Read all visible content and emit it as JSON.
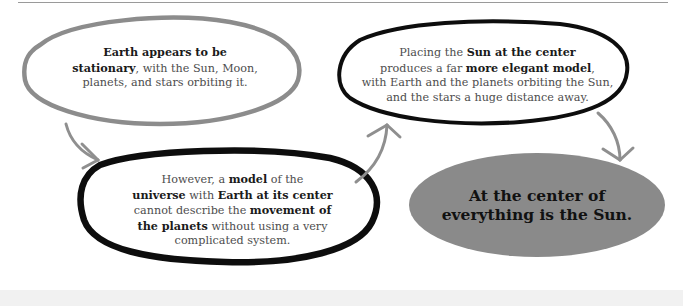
{
  "diagram": {
    "title_rule": true,
    "nodes": [
      {
        "id": "geocentric-observation",
        "style": "gray-outline",
        "segments": [
          {
            "text": "Earth appears to be",
            "bold": true
          },
          {
            "text": "stationary",
            "bold": true
          },
          {
            "text": ", with the Sun, Moon,",
            "bold": false
          },
          {
            "text": "planets, and stars orbiting it.",
            "bold": false
          }
        ]
      },
      {
        "id": "geocentric-problem",
        "style": "thick-black-outline",
        "segments": [
          {
            "text": "However, a ",
            "bold": false
          },
          {
            "text": "model",
            "bold": true
          },
          {
            "text": " of the",
            "bold": false
          },
          {
            "text": "universe",
            "bold": true
          },
          {
            "text": " with ",
            "bold": false
          },
          {
            "text": "Earth at its center",
            "bold": true
          },
          {
            "text": "cannot describe the ",
            "bold": false
          },
          {
            "text": "movement of",
            "bold": true
          },
          {
            "text": "the planets",
            "bold": true
          },
          {
            "text": " without using a very",
            "bold": false
          },
          {
            "text": "complicated system.",
            "bold": false
          }
        ]
      },
      {
        "id": "heliocentric-model",
        "style": "black-outline",
        "segments": [
          {
            "text": "Placing the ",
            "bold": false
          },
          {
            "text": "Sun at the center",
            "bold": true
          },
          {
            "text": "produces a far ",
            "bold": false
          },
          {
            "text": "more elegant model",
            "bold": true
          },
          {
            "text": ",",
            "bold": false
          },
          {
            "text": "with Earth and the planets orbiting the Sun,",
            "bold": false
          },
          {
            "text": "and the stars a huge distance away.",
            "bold": false
          }
        ]
      },
      {
        "id": "conclusion",
        "style": "gray-filled",
        "lines": [
          "At the center of",
          "everything is the Sun."
        ]
      }
    ],
    "edges": [
      {
        "from": "geocentric-observation",
        "to": "geocentric-problem"
      },
      {
        "from": "geocentric-problem",
        "to": "heliocentric-model"
      },
      {
        "from": "heliocentric-model",
        "to": "conclusion"
      }
    ],
    "colors": {
      "gray_outline": "#8c8c8c",
      "black_outline": "#0d0d0d",
      "arrow": "#8f8f8f",
      "conclusion_fill": "#8a8a8a",
      "rule": "#9a9a9a",
      "body_text": "#4d4d4d",
      "bold_text": "#1a1a1a"
    }
  }
}
